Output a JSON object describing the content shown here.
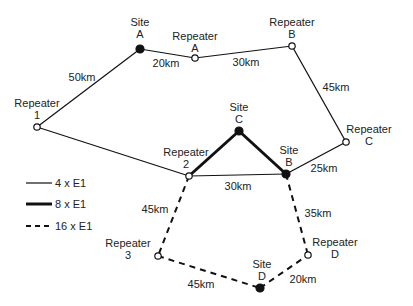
{
  "nodes": [
    {
      "id": "siteA",
      "line1": "Site",
      "line2": "A",
      "type": "site",
      "x": 140,
      "y": 49,
      "lx": 140,
      "ly": 26
    },
    {
      "id": "repA",
      "line1": "Repeater",
      "line2": "A",
      "type": "repeater",
      "x": 195,
      "y": 58,
      "lx": 195,
      "ly": 40
    },
    {
      "id": "repB",
      "line1": "Repeater",
      "line2": "B",
      "type": "repeater",
      "x": 292,
      "y": 46,
      "lx": 292,
      "ly": 26
    },
    {
      "id": "rep1",
      "line1": "Repeater",
      "line2": "1",
      "type": "repeater",
      "x": 37,
      "y": 127,
      "lx": 37,
      "ly": 107
    },
    {
      "id": "siteC",
      "line1": "Site",
      "line2": "C",
      "type": "site",
      "x": 239,
      "y": 131,
      "lx": 239,
      "ly": 111
    },
    {
      "id": "repC",
      "line1": "Repeater",
      "line2": "C",
      "type": "repeater",
      "x": 346,
      "y": 142,
      "lx": 369,
      "ly": 133
    },
    {
      "id": "rep2",
      "line1": "Repeater",
      "line2": "2",
      "type": "repeater",
      "x": 189,
      "y": 176,
      "lx": 186,
      "ly": 156
    },
    {
      "id": "siteB",
      "line1": "Site",
      "line2": "B",
      "type": "site",
      "x": 286,
      "y": 174,
      "lx": 289,
      "ly": 154
    },
    {
      "id": "rep3",
      "line1": "Repeater",
      "line2": "3",
      "type": "repeater",
      "x": 158,
      "y": 256,
      "lx": 128,
      "ly": 247
    },
    {
      "id": "repD",
      "line1": "Repeater",
      "line2": "D",
      "type": "repeater",
      "x": 308,
      "y": 255,
      "lx": 335,
      "ly": 246
    },
    {
      "id": "siteD",
      "line1": "Site",
      "line2": "D",
      "type": "site",
      "x": 260,
      "y": 288,
      "lx": 262,
      "ly": 268
    }
  ],
  "links": [
    {
      "from": "siteA",
      "to": "rep1",
      "label": "50km",
      "capacity": "4 x E1",
      "lx": 82,
      "ly": 81
    },
    {
      "from": "siteA",
      "to": "repA",
      "label": "20km",
      "capacity": "4 x E1",
      "lx": 166,
      "ly": 67
    },
    {
      "from": "repA",
      "to": "repB",
      "label": "30km",
      "capacity": "4 x E1",
      "lx": 246,
      "ly": 66
    },
    {
      "from": "repB",
      "to": "repC",
      "label": "45km",
      "capacity": "4 x E1",
      "lx": 336,
      "ly": 91
    },
    {
      "from": "rep1",
      "to": "rep2",
      "label": "",
      "capacity": "4 x E1",
      "lx": 0,
      "ly": 0
    },
    {
      "from": "rep2",
      "to": "siteB",
      "label": "30km",
      "capacity": "4 x E1",
      "lx": 238,
      "ly": 190
    },
    {
      "from": "siteB",
      "to": "repC",
      "label": "25km",
      "capacity": "4 x E1",
      "lx": 324,
      "ly": 172
    },
    {
      "from": "rep2",
      "to": "siteC",
      "label": "",
      "capacity": "8 x E1",
      "lx": 0,
      "ly": 0
    },
    {
      "from": "siteC",
      "to": "siteB",
      "label": "",
      "capacity": "8 x E1",
      "lx": 0,
      "ly": 0
    },
    {
      "from": "rep2",
      "to": "rep3",
      "label": "45km",
      "capacity": "16 x E1",
      "lx": 155,
      "ly": 213
    },
    {
      "from": "rep3",
      "to": "siteD",
      "label": "45km",
      "capacity": "16 x E1",
      "lx": 201,
      "ly": 288
    },
    {
      "from": "siteD",
      "to": "repD",
      "label": "20km",
      "capacity": "16 x E1",
      "lx": 303,
      "ly": 283
    },
    {
      "from": "siteB",
      "to": "repD",
      "label": "35km",
      "capacity": "16 x E1",
      "lx": 318,
      "ly": 217
    }
  ],
  "legend": [
    {
      "label": "4 x E1",
      "style": "thin"
    },
    {
      "label": "8 x E1",
      "style": "thick"
    },
    {
      "label": "16 x E1",
      "style": "dashed"
    }
  ]
}
